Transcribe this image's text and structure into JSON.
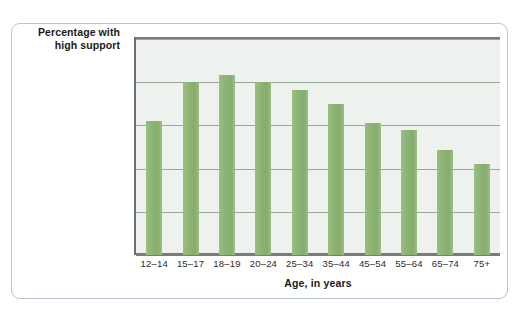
{
  "chart_data": {
    "type": "bar",
    "title": "",
    "subtitle": "",
    "xlabel": "Age, in years",
    "ylabel": "Percentage with high support",
    "ylabel_lines": [
      "Percentage with",
      "high support"
    ],
    "categories": [
      "12–14",
      "15–17",
      "18–19",
      "20–24",
      "25–34",
      "35–44",
      "45–54",
      "55–64",
      "65–74",
      "75+"
    ],
    "values": [
      81,
      90,
      91.7,
      90,
      88.3,
      85,
      80.5,
      79,
      74.3,
      71
    ],
    "ylim": [
      50,
      100
    ],
    "yticks": [
      50,
      60,
      70,
      80,
      90,
      100
    ],
    "ytick_labels": [
      "50",
      "60",
      "70",
      "80",
      "90",
      "100%"
    ],
    "grid": true,
    "legend": "none",
    "series_color": "#8fb577",
    "plot_background": "#edf2ee",
    "card_border_color": "#b9c4d2",
    "axis_color": "#7b7b7b",
    "gridline_color": "#9aa59c"
  }
}
